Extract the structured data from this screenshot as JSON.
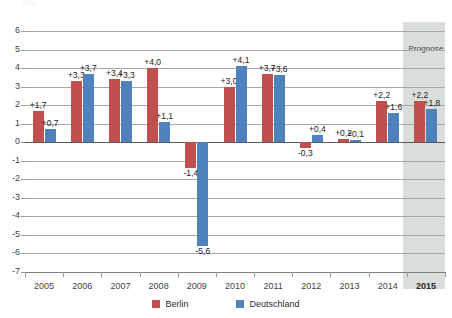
{
  "chart_data": {
    "type": "bar",
    "title": "",
    "xlabel": "",
    "ylabel": "",
    "ylim": [
      -7,
      6
    ],
    "grid": true,
    "legend_position": "bottom",
    "categories": [
      "2005",
      "2006",
      "2007",
      "2008",
      "2009",
      "2010",
      "2011",
      "2012",
      "2013",
      "2014",
      "2015"
    ],
    "series": [
      {
        "name": "Berlin",
        "color": "#c0504d",
        "values": [
          1.7,
          3.3,
          3.4,
          4.0,
          -1.4,
          3.0,
          3.7,
          -0.3,
          0.2,
          2.2,
          2.2
        ],
        "labels": [
          "+1,7",
          "+3,3",
          "+3,4",
          "+4,0",
          "-1,4",
          "+3,0",
          "+3,7",
          "-0,3",
          "+0,2",
          "+2,2",
          "+2,2"
        ]
      },
      {
        "name": "Deutschland",
        "color": "#4f81bd",
        "values": [
          0.7,
          3.7,
          3.3,
          1.1,
          -5.6,
          4.1,
          3.6,
          0.4,
          0.1,
          1.6,
          1.8
        ],
        "labels": [
          "+0,7",
          "+3,7",
          "+3,3",
          "+1,1",
          "-5,6",
          "+4,1",
          "+3,6",
          "+0,4",
          "+0,1",
          "+1,6",
          "+1,8"
        ]
      }
    ],
    "ytick_labels": [
      "6",
      "5",
      "4",
      "3",
      "2",
      "1",
      "0",
      "-1",
      "-2",
      "-3",
      "-4",
      "-5",
      "-6",
      "-7"
    ],
    "annotations": [
      {
        "text": "Prognose",
        "category": "2015",
        "kind": "shaded-band-label"
      }
    ]
  },
  "legend": {
    "items": [
      {
        "label": "Berlin",
        "color": "#c0504d"
      },
      {
        "label": "Deutschland",
        "color": "#4f81bd"
      }
    ]
  }
}
